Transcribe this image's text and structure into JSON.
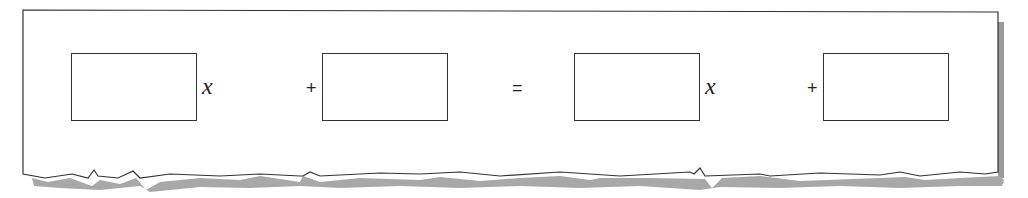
{
  "equation": {
    "terms": [
      {
        "box": "blank",
        "variable": "x"
      },
      {
        "operator": "+"
      },
      {
        "box": "blank"
      },
      {
        "operator": "="
      },
      {
        "box": "blank",
        "variable": "x"
      },
      {
        "operator": "+"
      },
      {
        "box": "blank"
      }
    ],
    "var1": "x",
    "plus1": "+",
    "equals": "=",
    "var2": "x",
    "plus2": "+"
  },
  "colors": {
    "border": "#333333",
    "shadow": "#9a9a9a",
    "paper": "#ffffff"
  }
}
